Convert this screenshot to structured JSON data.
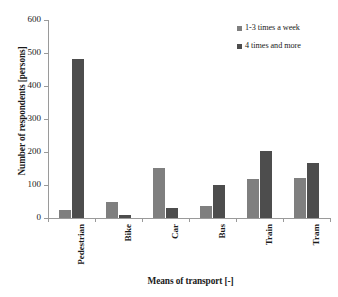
{
  "chart_data": {
    "type": "bar",
    "title": "",
    "xlabel": "Means of transport [-]",
    "ylabel": "Number of respondents [persons]",
    "categories": [
      "Pedestrian",
      "Bike",
      "Car",
      "Bus",
      "Train",
      "Tram"
    ],
    "series": [
      {
        "name": "1-3 times a week",
        "color": "#7f7f7f",
        "values": [
          25,
          48,
          151,
          37,
          117,
          122
        ]
      },
      {
        "name": "4 times and more",
        "color": "#4d4d4d",
        "values": [
          482,
          10,
          30,
          99,
          203,
          166
        ]
      }
    ],
    "ylim": [
      0,
      600
    ],
    "yticks": [
      0,
      100,
      200,
      300,
      400,
      500,
      600
    ],
    "ytick_labels": [
      "0",
      "100",
      "200",
      "300",
      "400",
      "500",
      "600"
    ],
    "grid": false,
    "legend_position": "top-right"
  }
}
